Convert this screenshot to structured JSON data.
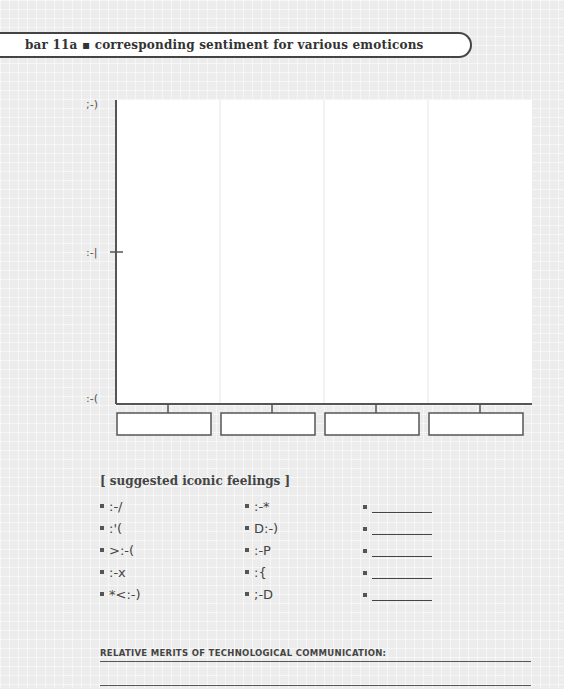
{
  "header": {
    "title": "bar 11a ▪ corresponding sentiment for various emoticons"
  },
  "chart_data": {
    "type": "bar",
    "title": "bar 11a ▪ corresponding sentiment for various emoticons",
    "xlabel": "",
    "ylabel": "",
    "categories": [
      "",
      "",
      "",
      ""
    ],
    "values": [
      null,
      null,
      null,
      null
    ],
    "y_ticks": [
      {
        "label": ";-)",
        "level": 1.0
      },
      {
        "label": ":-|",
        "level": 0.5
      },
      {
        "label": ":-(",
        "level": 0.0
      }
    ],
    "ylim": [
      0,
      1
    ],
    "grid": "vertical",
    "category_label_boxes": "empty"
  },
  "suggestions": {
    "heading": "[ suggested iconic feelings ]",
    "column1": [
      ":-/",
      ":'(",
      ">:-(",
      ":-x",
      "*<:-)"
    ],
    "column2": [
      ":-*",
      "D:-)",
      ":-P",
      ":{",
      ";-D"
    ],
    "column3_blank_count": 5
  },
  "merits": {
    "label": "RELATIVE MERITS OF TECHNOLOGICAL COMMUNICATION:"
  }
}
